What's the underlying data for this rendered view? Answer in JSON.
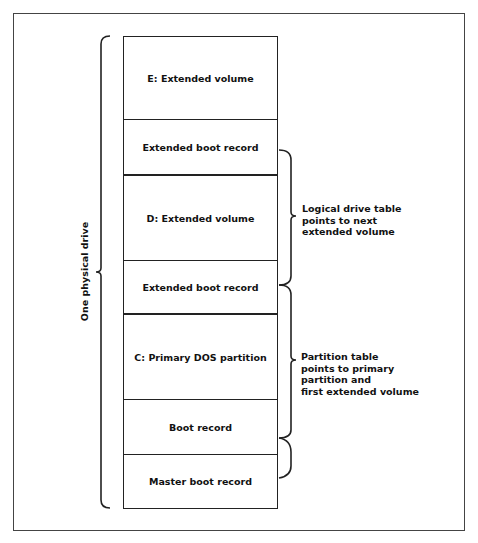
{
  "diagram": {
    "side_label": "One physical drive",
    "rows": [
      {
        "label": "E: Extended volume",
        "top": 0,
        "height": 83
      },
      {
        "label": "Extended boot record",
        "top": 83,
        "height": 55
      },
      {
        "label": "D: Extended volume",
        "top": 138,
        "height": 86
      },
      {
        "label": "Extended boot record",
        "top": 224,
        "height": 53
      },
      {
        "label": "C: Primary DOS partition",
        "top": 277,
        "height": 86
      },
      {
        "label": "Boot record",
        "top": 363,
        "height": 55
      },
      {
        "label": "Master boot record",
        "top": 418,
        "height": 55
      }
    ],
    "notes": {
      "logical_drive_table": [
        "Logical drive table",
        "points to next",
        "extended volume"
      ],
      "partition_table": [
        "Partition table",
        "points to primary",
        "partition and",
        "first extended volume"
      ]
    },
    "colors": {
      "line": "#222222",
      "frame": "#444444",
      "background": "#ffffff"
    }
  }
}
